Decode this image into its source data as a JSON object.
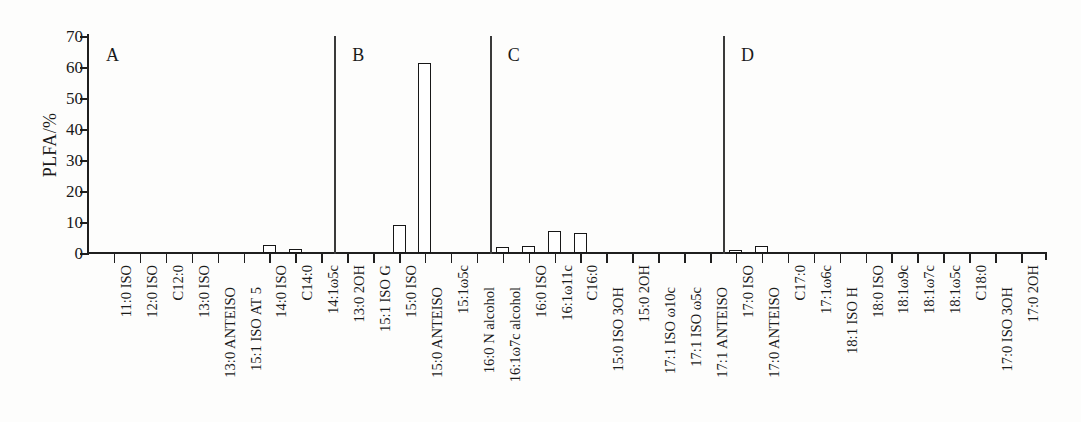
{
  "chart_data": {
    "type": "bar",
    "title": "",
    "xlabel": "",
    "ylabel": "PLFA/%",
    "ylim": [
      0,
      70
    ],
    "yticks": [
      0,
      10,
      20,
      30,
      40,
      50,
      60,
      70
    ],
    "grid": false,
    "legend": null,
    "categories": [
      "11:0 ISO",
      "12:0 ISO",
      "C12:0",
      "13:0 ISO",
      "13:0 ANTEISO",
      "15:1 ISO AT 5",
      "14:0 ISO",
      "C14:0",
      "14:1ω5c",
      "13:0 2OH",
      "15:1 ISO G",
      "15:0 ISO",
      "15:0 ANTEISO",
      "15:1ω5c",
      "16:0 N alcohol",
      "16:1ω7c alcohol",
      "16:0 ISO",
      "16:1ω11c",
      "C16:0",
      "15:0 ISO 3OH",
      "15:0 2OH",
      "17:1 ISO ω10c",
      "17:1 ISO ω5c",
      "17:1 ANTEISO",
      "17:0 ISO",
      "17:0 ANTEISO",
      "C17:0",
      "17:1ω6c",
      "18:1 ISO H",
      "18:0 ISO",
      "18:1ω9c",
      "18:1ω7c",
      "18:1ω5c",
      "C18:0",
      "17:0 ISO 3OH",
      "17:0 2OH"
    ],
    "values": [
      0,
      0,
      0,
      0,
      0,
      0,
      2.6,
      1.3,
      0,
      0,
      0,
      9.0,
      61.3,
      0,
      0,
      1.8,
      2.3,
      7.0,
      6.3,
      0,
      0,
      0,
      0,
      0,
      0.9,
      2.3,
      0,
      0,
      0,
      0,
      0,
      0,
      0,
      0,
      0,
      0
    ],
    "group_dividers": [
      {
        "label": "A",
        "after_category_index": -1
      },
      {
        "label": "B",
        "after_category_index": 8
      },
      {
        "label": "C",
        "after_category_index": 14
      },
      {
        "label": "D",
        "after_category_index": 23
      }
    ],
    "group_labels": [
      "A",
      "B",
      "C",
      "D"
    ]
  }
}
